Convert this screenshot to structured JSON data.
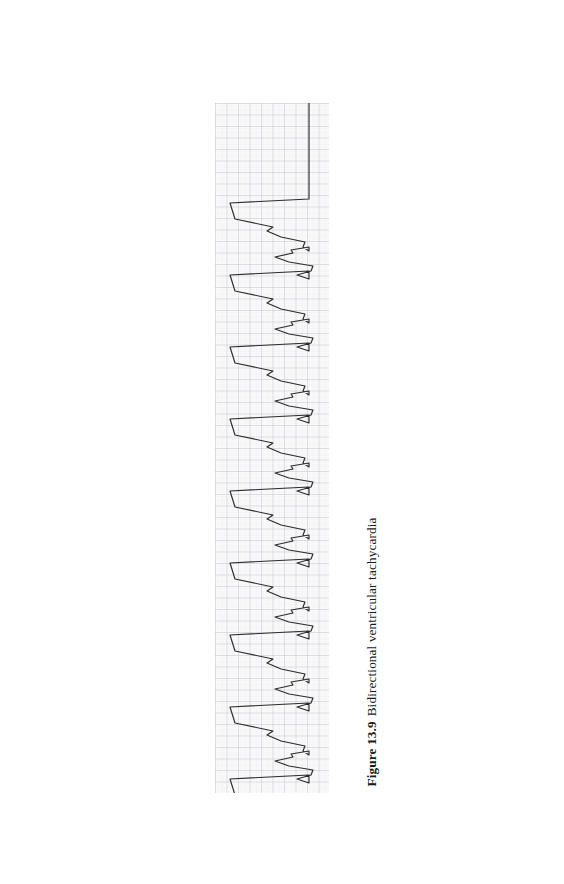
{
  "page": {
    "background_color": "#ffffff",
    "width": 564,
    "height": 884
  },
  "caption": {
    "label": "Figure 13.9",
    "text": "Bidirectional ventricular tachycardia",
    "full": "Figure 13.9  Bidirectional ventricular tachycardia",
    "orientation": "rotated-90-ccw",
    "color": "#1a1a1a"
  },
  "ecg": {
    "title": "Bidirectional ventricular tachycardia rhythm strip",
    "orientation": "rotated-90-ccw",
    "paper_color": "#fdfdfd",
    "grid_minor_color": "#dcdce2",
    "grid_major_color": "#b9b9c4",
    "grid_minor_px": 2.3,
    "grid_major_px": 11.5,
    "trace_color": "#2b2b2b",
    "trace_width_px": 1.15,
    "strip": {
      "left": 215,
      "top": 103,
      "width": 114,
      "height": 690
    }
  },
  "chart_data": {
    "type": "line",
    "title": "Bidirectional ventricular tachycardia",
    "subtitle": "Figure 13.9",
    "xlabel": "Time (rotated: runs top to bottom)",
    "ylabel": "Amplitude (rotated: runs right to left)",
    "grid": true,
    "legend": "none",
    "orientation": "rotated-90-ccw",
    "baseline_x_px": 287,
    "xlim_px": [
      0,
      114
    ],
    "ylim_px": [
      0,
      690
    ],
    "rhythm": "bidirectional ventricular tachycardia",
    "beat_period_px": 72,
    "beat_count": 19,
    "beats": [
      {
        "index": 1,
        "type": "major",
        "t_px": 122,
        "peak_px": 230
      },
      {
        "index": 2,
        "type": "minor",
        "t_px": 158,
        "peak_px": 262
      },
      {
        "index": 3,
        "type": "major",
        "t_px": 194,
        "peak_px": 230
      },
      {
        "index": 4,
        "type": "minor",
        "t_px": 230,
        "peak_px": 262
      },
      {
        "index": 5,
        "type": "major",
        "t_px": 266,
        "peak_px": 230
      },
      {
        "index": 6,
        "type": "minor",
        "t_px": 302,
        "peak_px": 262
      },
      {
        "index": 7,
        "type": "major",
        "t_px": 338,
        "peak_px": 230
      },
      {
        "index": 8,
        "type": "minor",
        "t_px": 374,
        "peak_px": 262
      },
      {
        "index": 9,
        "type": "major",
        "t_px": 410,
        "peak_px": 230
      },
      {
        "index": 10,
        "type": "minor",
        "t_px": 446,
        "peak_px": 262
      },
      {
        "index": 11,
        "type": "major",
        "t_px": 482,
        "peak_px": 230
      },
      {
        "index": 12,
        "type": "minor",
        "t_px": 518,
        "peak_px": 262
      },
      {
        "index": 13,
        "type": "major",
        "t_px": 554,
        "peak_px": 230
      },
      {
        "index": 14,
        "type": "minor",
        "t_px": 590,
        "peak_px": 262
      },
      {
        "index": 15,
        "type": "major",
        "t_px": 626,
        "peak_px": 230
      },
      {
        "index": 16,
        "type": "minor",
        "t_px": 662,
        "peak_px": 262
      },
      {
        "index": 17,
        "type": "major",
        "t_px": 698,
        "peak_px": 230
      },
      {
        "index": 18,
        "type": "minor",
        "t_px": 734,
        "peak_px": 262
      },
      {
        "index": 19,
        "type": "major",
        "t_px": 770,
        "peak_px": 230
      }
    ]
  }
}
